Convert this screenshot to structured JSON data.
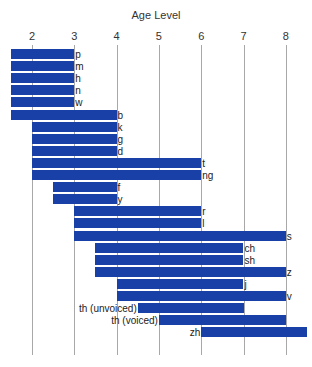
{
  "chart_data": {
    "type": "bar",
    "orientation": "horizontal-range",
    "title": "Age Level",
    "xlabel": "Age Level",
    "ylabel": "",
    "x_ticks": [
      2,
      3,
      4,
      5,
      6,
      7,
      8
    ],
    "xlim": [
      1.5,
      8.5
    ],
    "grid": true,
    "bar_color": "#1840a6",
    "categories": [
      "p",
      "m",
      "h",
      "n",
      "w",
      "b",
      "k",
      "g",
      "d",
      "t",
      "ng",
      "f",
      "y",
      "r",
      "l",
      "s",
      "ch",
      "sh",
      "z",
      "j",
      "v",
      "th (unvoiced)",
      "th (voiced)",
      "zh"
    ],
    "series": [
      {
        "name": "start_age",
        "values": [
          1.5,
          1.5,
          1.5,
          1.5,
          1.5,
          1.5,
          2,
          2,
          2,
          2,
          2,
          2.5,
          2.5,
          3,
          3,
          3,
          3.5,
          3.5,
          3.5,
          4,
          4,
          4.5,
          5,
          6
        ]
      },
      {
        "name": "end_age",
        "values": [
          3,
          3,
          3,
          3,
          3,
          4,
          4,
          4,
          4,
          6,
          6,
          4,
          4,
          6,
          6,
          8,
          7,
          7,
          8,
          7,
          8,
          7,
          8,
          8.5
        ]
      }
    ],
    "bars": [
      {
        "label": "p",
        "start": 1.5,
        "end": 3,
        "label_side": "right"
      },
      {
        "label": "m",
        "start": 1.5,
        "end": 3,
        "label_side": "right"
      },
      {
        "label": "h",
        "start": 1.5,
        "end": 3,
        "label_side": "right"
      },
      {
        "label": "n",
        "start": 1.5,
        "end": 3,
        "label_side": "right"
      },
      {
        "label": "w",
        "start": 1.5,
        "end": 3,
        "label_side": "right"
      },
      {
        "label": "b",
        "start": 1.5,
        "end": 4,
        "label_side": "right"
      },
      {
        "label": "k",
        "start": 2,
        "end": 4,
        "label_side": "right"
      },
      {
        "label": "g",
        "start": 2,
        "end": 4,
        "label_side": "right"
      },
      {
        "label": "d",
        "start": 2,
        "end": 4,
        "label_side": "right"
      },
      {
        "label": "t",
        "start": 2,
        "end": 6,
        "label_side": "right"
      },
      {
        "label": "ng",
        "start": 2,
        "end": 6,
        "label_side": "right"
      },
      {
        "label": "f",
        "start": 2.5,
        "end": 4,
        "label_side": "right"
      },
      {
        "label": "y",
        "start": 2.5,
        "end": 4,
        "label_side": "right"
      },
      {
        "label": "r",
        "start": 3,
        "end": 6,
        "label_side": "right"
      },
      {
        "label": "l",
        "start": 3,
        "end": 6,
        "label_side": "right"
      },
      {
        "label": "s",
        "start": 3,
        "end": 8,
        "label_side": "right"
      },
      {
        "label": "ch",
        "start": 3.5,
        "end": 7,
        "label_side": "right"
      },
      {
        "label": "sh",
        "start": 3.5,
        "end": 7,
        "label_side": "right"
      },
      {
        "label": "z",
        "start": 3.5,
        "end": 8,
        "label_side": "right"
      },
      {
        "label": "j",
        "start": 4,
        "end": 7,
        "label_side": "right"
      },
      {
        "label": "v",
        "start": 4,
        "end": 8,
        "label_side": "right"
      },
      {
        "label": "th (unvoiced)",
        "start": 4.5,
        "end": 7,
        "label_side": "left"
      },
      {
        "label": "th (voiced)",
        "start": 5,
        "end": 8,
        "label_side": "left"
      },
      {
        "label": "zh",
        "start": 6,
        "end": 8.5,
        "label_side": "left"
      }
    ]
  }
}
